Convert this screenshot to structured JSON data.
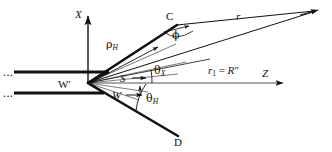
{
  "figure": {
    "type": "geometry-diagram",
    "background": "#ffffff",
    "ink": "#111111",
    "width": 332,
    "height": 152
  },
  "axes": {
    "x_axis": {
      "label": "X",
      "style": "italic",
      "direction": "up",
      "tip": [
        88,
        14
      ],
      "tail": [
        88,
        83
      ]
    },
    "z_axis": {
      "label": "Z",
      "style": "italic",
      "direction": "right",
      "tail": [
        88,
        83
      ],
      "tip": [
        285,
        83
      ]
    }
  },
  "points": {
    "origin": {
      "label": "W'",
      "style": "upright",
      "x": 88,
      "y": 83
    },
    "c_point": {
      "label": "C",
      "style": "upright",
      "x": 172,
      "y": 23
    },
    "d_point": {
      "label": "D",
      "style": "upright",
      "x": 178,
      "y": 137
    },
    "far_field": {
      "label": "",
      "x": 319,
      "y": 9
    }
  },
  "labels": {
    "rho_h": {
      "symbol": "ρ",
      "subscript": "H",
      "text": "ρH"
    },
    "r_ray": {
      "symbol": "r",
      "style": "italic",
      "text": "r"
    },
    "r1_equals_rpp": {
      "lead": "r",
      "lead_sub": "1",
      "operator": "=",
      "trail": "R",
      "trail_prime": "″",
      "text": "r1 = R″"
    },
    "s_vector": {
      "text": "S",
      "style": "italic",
      "arrow": "right"
    },
    "w_vector": {
      "text": "W",
      "style": "italic",
      "arrow": "right"
    },
    "theta_x": {
      "symbol": "θ",
      "subscript": "X",
      "text": "θX"
    },
    "theta_h": {
      "symbol": "θ",
      "subscript": "H",
      "text": "θH"
    },
    "phi": {
      "symbol": "ϕ",
      "text": "ϕ"
    },
    "ellipsis_upper": {
      "text": "..."
    },
    "ellipsis_lower": {
      "text": "..."
    }
  },
  "label_positions": {
    "x_axis": [
      77,
      16
    ],
    "z_axis": [
      264,
      76
    ],
    "origin": [
      62,
      87
    ],
    "c_point": [
      167,
      19
    ],
    "d_point": [
      175,
      143
    ],
    "rho_h": [
      111,
      44
    ],
    "r_ray": [
      237,
      17
    ],
    "r1_expr": [
      210,
      71
    ],
    "s_vector": [
      121,
      81
    ],
    "w_vector": [
      113,
      97
    ],
    "theta_x": [
      155,
      70
    ],
    "theta_h": [
      148,
      98
    ],
    "phi": [
      175,
      37
    ],
    "ellipsis_upper": [
      3,
      76
    ],
    "ellipsis_lower": [
      3,
      97
    ]
  },
  "geometry": {
    "waveguide_upper": {
      "x1": 14,
      "y1": 72,
      "x2": 108,
      "y2": 72,
      "thick": true
    },
    "waveguide_lower": {
      "x1": 14,
      "y1": 93,
      "x2": 103,
      "y2": 93,
      "thick": true
    },
    "flare_upper": {
      "x1": 108,
      "y1": 72,
      "x2": 88,
      "y2": 83
    },
    "flare_lower": {
      "x1": 103,
      "y1": 93,
      "x2": 88,
      "y2": 83
    },
    "horn_upper_edge": {
      "x1": 88,
      "y1": 83,
      "x2": 176,
      "y2": 25,
      "thick": true
    },
    "horn_lower_edge": {
      "x1": 88,
      "y1": 83,
      "x2": 176,
      "y2": 135,
      "thick": true
    },
    "ray_r_from_c": {
      "x1": 176,
      "y1": 25,
      "x2": 319,
      "y2": 9
    },
    "ray_r1_from_origin": {
      "x1": 88,
      "y1": 83,
      "x2": 319,
      "y2": 9
    },
    "ray_theta_x": {
      "x1": 88,
      "y1": 83,
      "x2": 205,
      "y2": 60
    },
    "rho_arrow": {
      "x1": 88,
      "y1": 83,
      "x2": 160,
      "y2": 46
    },
    "s_arrow": {
      "x1": 110,
      "y1": 78,
      "x2": 143,
      "y2": 78
    },
    "w_arrow": {
      "x1": 103,
      "y1": 94,
      "x2": 141,
      "y2": 94
    },
    "theta_x_arc": {
      "cx": 88,
      "cy": 83,
      "r": 64,
      "from_deg": 0,
      "to_deg": 11
    },
    "theta_h_arc": {
      "cx": 88,
      "cy": 83,
      "r": 58,
      "from_deg": 0,
      "to_deg": -31
    },
    "phi_arc": {
      "cx": 176,
      "cy": 25,
      "r": 22
    }
  }
}
